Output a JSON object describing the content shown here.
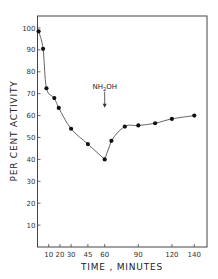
{
  "chart_data": {
    "type": "line",
    "title": "",
    "xlabel": "TIME , MINUTES",
    "ylabel": "PER CENT ACTIVITY",
    "xlim": [
      0,
      150
    ],
    "ylim": [
      0,
      105
    ],
    "grid": false,
    "legend": null,
    "x_ticks": [
      10,
      20,
      30,
      45,
      60,
      90,
      120,
      140
    ],
    "x_tick_labels": [
      "10",
      "20",
      "30",
      "45",
      "60",
      "90",
      "120",
      "140"
    ],
    "y_ticks": [
      10,
      20,
      30,
      40,
      50,
      60,
      70,
      80,
      90,
      100
    ],
    "y_tick_labels": [
      "10",
      "20",
      "30",
      "40",
      "50",
      "60",
      "70",
      "80",
      "90",
      "100"
    ],
    "series": [
      {
        "name": "activity",
        "x": [
          1,
          5,
          8,
          15,
          19,
          30,
          45,
          60,
          66,
          78,
          90,
          105,
          120,
          140
        ],
        "y": [
          98.5,
          90.5,
          72.5,
          68,
          63.5,
          54,
          47,
          40,
          48.5,
          55,
          55.5,
          56.5,
          58.5,
          60
        ]
      }
    ],
    "annotations": [
      {
        "text": "NH2OH",
        "x": 60,
        "y": 70,
        "arrow": "down"
      }
    ]
  },
  "annotation": {
    "reagent_prefix": "NH",
    "reagent_sub": "2",
    "reagent_suffix": "OH"
  }
}
